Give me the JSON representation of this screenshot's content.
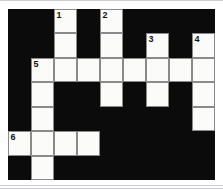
{
  "puzzle": {
    "title": "Crossword Grid",
    "columns": 9,
    "rows": 7,
    "colors": {
      "block": "#0b0b0b",
      "open_cell": "#fbfbf9",
      "cell_border": "#8a8a8a",
      "number_text": "#111111",
      "page_background": "#ffffff",
      "page_rule": "#c9cdd2"
    },
    "clue_numbers_visible": [
      "1",
      "2",
      "3",
      "4",
      "5",
      "6"
    ],
    "grid": [
      [
        {
          "state": "block",
          "number": "",
          "letter": ""
        },
        {
          "state": "block",
          "number": "",
          "letter": ""
        },
        {
          "state": "open",
          "number": "1",
          "letter": ""
        },
        {
          "state": "block",
          "number": "",
          "letter": ""
        },
        {
          "state": "open",
          "number": "2",
          "letter": ""
        },
        {
          "state": "block",
          "number": "",
          "letter": ""
        },
        {
          "state": "block",
          "number": "",
          "letter": ""
        },
        {
          "state": "block",
          "number": "",
          "letter": ""
        },
        {
          "state": "block",
          "number": "",
          "letter": ""
        }
      ],
      [
        {
          "state": "block",
          "number": "",
          "letter": ""
        },
        {
          "state": "block",
          "number": "",
          "letter": ""
        },
        {
          "state": "open",
          "number": "",
          "letter": ""
        },
        {
          "state": "block",
          "number": "",
          "letter": ""
        },
        {
          "state": "open",
          "number": "",
          "letter": ""
        },
        {
          "state": "block",
          "number": "",
          "letter": ""
        },
        {
          "state": "open",
          "number": "3",
          "letter": ""
        },
        {
          "state": "block",
          "number": "",
          "letter": ""
        },
        {
          "state": "open",
          "number": "4",
          "letter": ""
        }
      ],
      [
        {
          "state": "block",
          "number": "",
          "letter": ""
        },
        {
          "state": "open",
          "number": "5",
          "letter": ""
        },
        {
          "state": "open",
          "number": "",
          "letter": ""
        },
        {
          "state": "open",
          "number": "",
          "letter": ""
        },
        {
          "state": "open",
          "number": "",
          "letter": ""
        },
        {
          "state": "open",
          "number": "",
          "letter": ""
        },
        {
          "state": "open",
          "number": "",
          "letter": ""
        },
        {
          "state": "open",
          "number": "",
          "letter": ""
        },
        {
          "state": "open",
          "number": "",
          "letter": ""
        }
      ],
      [
        {
          "state": "block",
          "number": "",
          "letter": ""
        },
        {
          "state": "open",
          "number": "",
          "letter": ""
        },
        {
          "state": "block",
          "number": "",
          "letter": ""
        },
        {
          "state": "block",
          "number": "",
          "letter": ""
        },
        {
          "state": "open",
          "number": "",
          "letter": ""
        },
        {
          "state": "block",
          "number": "",
          "letter": ""
        },
        {
          "state": "open",
          "number": "",
          "letter": ""
        },
        {
          "state": "block",
          "number": "",
          "letter": ""
        },
        {
          "state": "open",
          "number": "",
          "letter": ""
        }
      ],
      [
        {
          "state": "block",
          "number": "",
          "letter": ""
        },
        {
          "state": "open",
          "number": "",
          "letter": ""
        },
        {
          "state": "block",
          "number": "",
          "letter": ""
        },
        {
          "state": "block",
          "number": "",
          "letter": ""
        },
        {
          "state": "block",
          "number": "",
          "letter": ""
        },
        {
          "state": "block",
          "number": "",
          "letter": ""
        },
        {
          "state": "block",
          "number": "",
          "letter": ""
        },
        {
          "state": "block",
          "number": "",
          "letter": ""
        },
        {
          "state": "open",
          "number": "",
          "letter": ""
        }
      ],
      [
        {
          "state": "open",
          "number": "6",
          "letter": ""
        },
        {
          "state": "open",
          "number": "",
          "letter": ""
        },
        {
          "state": "open",
          "number": "",
          "letter": ""
        },
        {
          "state": "open",
          "number": "",
          "letter": ""
        },
        {
          "state": "block",
          "number": "",
          "letter": ""
        },
        {
          "state": "block",
          "number": "",
          "letter": ""
        },
        {
          "state": "block",
          "number": "",
          "letter": ""
        },
        {
          "state": "block",
          "number": "",
          "letter": ""
        },
        {
          "state": "block",
          "number": "",
          "letter": ""
        }
      ],
      [
        {
          "state": "block",
          "number": "",
          "letter": ""
        },
        {
          "state": "open",
          "number": "",
          "letter": ""
        },
        {
          "state": "block",
          "number": "",
          "letter": ""
        },
        {
          "state": "block",
          "number": "",
          "letter": ""
        },
        {
          "state": "block",
          "number": "",
          "letter": ""
        },
        {
          "state": "block",
          "number": "",
          "letter": ""
        },
        {
          "state": "block",
          "number": "",
          "letter": ""
        },
        {
          "state": "block",
          "number": "",
          "letter": ""
        },
        {
          "state": "block",
          "number": "",
          "letter": ""
        }
      ]
    ]
  }
}
